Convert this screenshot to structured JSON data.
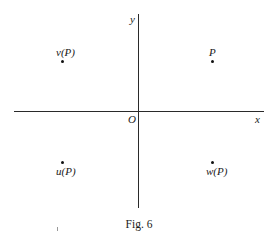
{
  "figure": {
    "caption": "Fig. 6",
    "axes": {
      "x_label": "x",
      "y_label": "y",
      "origin_label": "O"
    },
    "points": [
      {
        "id": "P",
        "label": "P",
        "quadrant": "I",
        "label_position": "above"
      },
      {
        "id": "vP",
        "label": "v(P)",
        "quadrant": "II",
        "label_position": "above"
      },
      {
        "id": "uP",
        "label": "u(P)",
        "quadrant": "III",
        "label_position": "below"
      },
      {
        "id": "wP",
        "label": "w(P)",
        "quadrant": "IV",
        "label_position": "below"
      }
    ]
  }
}
